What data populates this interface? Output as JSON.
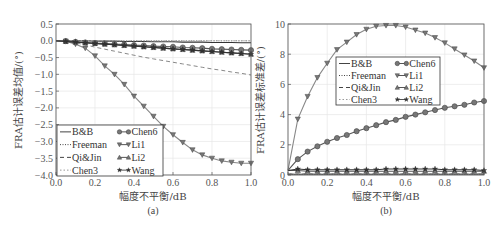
{
  "chart_data": [
    {
      "panel": "(a)",
      "type": "line",
      "title": "",
      "xlabel": "幅度不平衡/dB",
      "ylabel": "FRA估计误差均值/(°)",
      "caption": "(a)",
      "xlim": [
        0.0,
        1.0
      ],
      "ylim": [
        -4.0,
        0.5
      ],
      "xticks": [
        "0.0",
        "0.2",
        "0.4",
        "0.6",
        "0.8",
        "1.0"
      ],
      "yticks": [
        "0.5",
        "0.0",
        "-0.5",
        "-1.0",
        "-1.5",
        "-2.0",
        "-2.5",
        "-3.0",
        "-3.5",
        "-4.0"
      ],
      "grid": true,
      "legend_position": "lower left",
      "x": [
        0.0,
        0.05,
        0.1,
        0.15,
        0.2,
        0.25,
        0.3,
        0.35,
        0.4,
        0.45,
        0.5,
        0.55,
        0.6,
        0.65,
        0.7,
        0.75,
        0.8,
        0.85,
        0.9,
        0.95,
        1.0
      ],
      "series": [
        {
          "name": "B&B",
          "style": "solid",
          "marker": "none",
          "values": [
            0,
            0,
            0,
            0,
            -0.01,
            -0.01,
            -0.01,
            -0.02,
            -0.02,
            -0.02,
            -0.03,
            -0.03,
            -0.03,
            -0.04,
            -0.04,
            -0.04,
            -0.05,
            -0.05,
            -0.05,
            -0.06,
            -0.06
          ]
        },
        {
          "name": "Freeman",
          "style": "dotted",
          "marker": "none",
          "values": [
            0,
            0,
            0,
            0,
            0,
            0,
            0,
            0,
            0,
            0,
            0,
            0,
            0,
            0,
            0,
            0,
            0,
            0,
            0,
            0,
            0
          ]
        },
        {
          "name": "Qi&Jin",
          "style": "dashed",
          "marker": "none",
          "values": [
            0,
            -0.02,
            -0.06,
            -0.12,
            -0.19,
            -0.25,
            -0.31,
            -0.37,
            -0.43,
            -0.49,
            -0.54,
            -0.59,
            -0.64,
            -0.69,
            -0.74,
            -0.79,
            -0.84,
            -0.88,
            -0.93,
            -0.97,
            -1.02
          ]
        },
        {
          "name": "Chen3",
          "style": "dashdot",
          "marker": "none",
          "values": [
            0,
            0,
            0,
            0,
            0,
            0,
            0,
            0,
            0,
            0,
            0,
            0,
            0,
            0,
            0,
            0,
            0,
            0,
            0,
            0,
            0
          ]
        },
        {
          "name": "Chen6",
          "style": "solid",
          "marker": "circle",
          "values": [
            0,
            -0.01,
            -0.03,
            -0.05,
            -0.07,
            -0.08,
            -0.1,
            -0.11,
            -0.13,
            -0.14,
            -0.16,
            -0.17,
            -0.18,
            -0.2,
            -0.21,
            -0.22,
            -0.24,
            -0.25,
            -0.26,
            -0.27,
            -0.28
          ]
        },
        {
          "name": "Li1",
          "style": "solid",
          "marker": "triangle-down",
          "values": [
            0,
            -0.01,
            -0.1,
            -0.22,
            -0.45,
            -0.75,
            -1.0,
            -1.3,
            -1.65,
            -1.95,
            -2.25,
            -2.55,
            -2.8,
            -3.03,
            -3.25,
            -3.4,
            -3.5,
            -3.58,
            -3.62,
            -3.65,
            -3.65
          ]
        },
        {
          "name": "Li2",
          "style": "solid",
          "marker": "triangle-up",
          "values": [
            0,
            -0.02,
            -0.04,
            -0.06,
            -0.08,
            -0.1,
            -0.12,
            -0.14,
            -0.16,
            -0.18,
            -0.2,
            -0.22,
            -0.24,
            -0.26,
            -0.28,
            -0.3,
            -0.32,
            -0.34,
            -0.36,
            -0.38,
            -0.4
          ]
        },
        {
          "name": "Wang",
          "style": "solid",
          "marker": "star",
          "values": [
            0,
            -0.02,
            -0.04,
            -0.06,
            -0.08,
            -0.1,
            -0.12,
            -0.14,
            -0.16,
            -0.18,
            -0.2,
            -0.22,
            -0.24,
            -0.26,
            -0.28,
            -0.3,
            -0.32,
            -0.34,
            -0.36,
            -0.38,
            -0.4
          ]
        }
      ]
    },
    {
      "panel": "(b)",
      "type": "line",
      "title": "",
      "xlabel": "幅度不平衡/dB",
      "ylabel": "FRA估计误差标准差/(°)",
      "caption": "(b)",
      "xlim": [
        0.0,
        1.0
      ],
      "ylim": [
        0,
        10
      ],
      "xticks": [
        "0.0",
        "0.2",
        "0.4",
        "0.6",
        "0.8",
        "1.0"
      ],
      "yticks": [
        "10",
        "8",
        "6",
        "4",
        "2",
        "0"
      ],
      "grid": true,
      "legend_position": "upper center",
      "x": [
        0.0,
        0.05,
        0.1,
        0.15,
        0.2,
        0.25,
        0.3,
        0.35,
        0.4,
        0.45,
        0.5,
        0.55,
        0.6,
        0.65,
        0.7,
        0.75,
        0.8,
        0.85,
        0.9,
        0.95,
        1.0
      ],
      "series": [
        {
          "name": "B&B",
          "style": "solid",
          "marker": "none",
          "values": [
            0.05,
            0.05,
            0.05,
            0.05,
            0.05,
            0.05,
            0.05,
            0.05,
            0.05,
            0.05,
            0.05,
            0.05,
            0.05,
            0.05,
            0.05,
            0.05,
            0.05,
            0.05,
            0.05,
            0.05,
            0.05
          ]
        },
        {
          "name": "Freeman",
          "style": "dotted",
          "marker": "none",
          "values": [
            0.05,
            0.05,
            0.05,
            0.05,
            0.05,
            0.05,
            0.05,
            0.05,
            0.05,
            0.05,
            0.05,
            0.05,
            0.05,
            0.05,
            0.05,
            0.05,
            0.05,
            0.05,
            0.05,
            0.05,
            0.05
          ]
        },
        {
          "name": "Qi&Jin",
          "style": "dashed",
          "marker": "none",
          "values": [
            0.1,
            0.1,
            0.1,
            0.1,
            0.1,
            0.1,
            0.1,
            0.1,
            0.1,
            0.1,
            0.1,
            0.1,
            0.1,
            0.1,
            0.1,
            0.1,
            0.1,
            0.1,
            0.1,
            0.1,
            0.1
          ]
        },
        {
          "name": "Chen3",
          "style": "dashdot",
          "marker": "none",
          "values": [
            0.1,
            0.1,
            0.1,
            0.1,
            0.1,
            0.1,
            0.1,
            0.1,
            0.1,
            0.1,
            0.1,
            0.1,
            0.1,
            0.1,
            0.1,
            0.1,
            0.1,
            0.1,
            0.1,
            0.1,
            0.1
          ]
        },
        {
          "name": "Chen6",
          "style": "solid",
          "marker": "circle",
          "values": [
            0.3,
            1.05,
            1.55,
            1.9,
            2.2,
            2.45,
            2.65,
            2.9,
            3.1,
            3.3,
            3.5,
            3.65,
            3.85,
            4.0,
            4.15,
            4.3,
            4.45,
            4.55,
            4.65,
            4.8,
            4.9
          ]
        },
        {
          "name": "Li1",
          "style": "solid",
          "marker": "triangle-down",
          "values": [
            0.3,
            3.7,
            5.2,
            6.45,
            7.4,
            8.3,
            8.8,
            9.3,
            9.65,
            9.85,
            9.9,
            9.9,
            9.8,
            9.6,
            9.4,
            9.1,
            8.75,
            8.35,
            7.95,
            7.55,
            7.1
          ]
        },
        {
          "name": "Li2",
          "style": "solid",
          "marker": "triangle-up",
          "values": [
            0.3,
            0.3,
            0.25,
            0.25,
            0.25,
            0.25,
            0.25,
            0.25,
            0.25,
            0.25,
            0.25,
            0.25,
            0.25,
            0.25,
            0.25,
            0.25,
            0.25,
            0.25,
            0.25,
            0.25,
            0.25
          ]
        },
        {
          "name": "Wang",
          "style": "solid",
          "marker": "star",
          "values": [
            0.3,
            0.4,
            0.35,
            0.35,
            0.35,
            0.35,
            0.35,
            0.35,
            0.35,
            0.35,
            0.4,
            0.4,
            0.4,
            0.4,
            0.4,
            0.4,
            0.35,
            0.35,
            0.35,
            0.35,
            0.3
          ]
        }
      ]
    }
  ],
  "legend": {
    "col1": [
      "B&B",
      "Freeman",
      "Qi&Jin",
      "Chen3"
    ],
    "col2": [
      "Chen6",
      "Li1",
      "Li2",
      "Wang"
    ]
  },
  "colors": {
    "axis": "#555555",
    "grid": "#e6e6e6",
    "line_dark": "#333333",
    "line_light": "#888888",
    "marker_fill": "#777777"
  }
}
